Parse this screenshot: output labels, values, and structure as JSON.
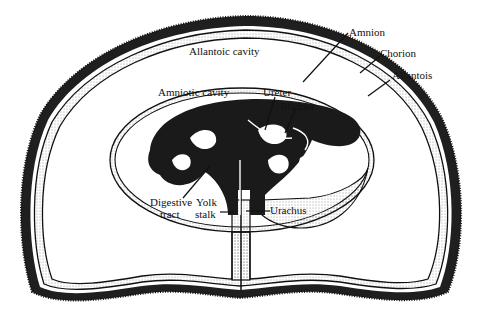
{
  "diagram": {
    "title": "",
    "labels": {
      "amnion": "Amnion",
      "chorion": "Chorion",
      "allantois": "Allantois",
      "allantoic_cavity": "Allantoic cavity",
      "amniotic_cavity": "Amniotic cavity",
      "ureter": "Ureter",
      "bladder": "Bladder",
      "digestive_tract_1": "Digestive",
      "digestive_tract_2": "tract",
      "yolk_stalk_1": "Yolk",
      "yolk_stalk_2": "stalk",
      "urachus": "Urachus"
    },
    "colors": {
      "ink": "#1a1a1a",
      "background": "#ffffff"
    }
  }
}
